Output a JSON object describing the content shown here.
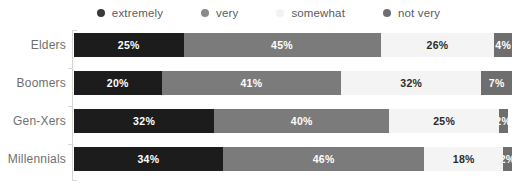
{
  "chart_data": {
    "type": "bar",
    "orientation": "horizontal",
    "stacked": true,
    "stack_total": 100,
    "unit": "%",
    "title": "",
    "subtitle": "",
    "xlabel": "",
    "ylabel": "",
    "xlim": [
      0,
      100
    ],
    "grid": false,
    "legend_position": "top",
    "categories": [
      "Elders",
      "Boomers",
      "Gen-Xers",
      "Millennials"
    ],
    "series": [
      {
        "name": "extremely",
        "color": "#1c1c1c",
        "label_color": "#ffffff",
        "values": [
          25,
          20,
          32,
          34
        ]
      },
      {
        "name": "very",
        "color": "#7b7b7b",
        "label_color": "#ffffff",
        "values": [
          45,
          41,
          40,
          46
        ]
      },
      {
        "name": "somewhat",
        "color": "#f4f4f4",
        "label_color": "#2b2b2b",
        "values": [
          26,
          32,
          25,
          18
        ]
      },
      {
        "name": "not very",
        "color": "#6e6e6e",
        "label_color": "#ffffff",
        "values": [
          4,
          7,
          2,
          2
        ]
      }
    ],
    "value_labels": [
      [
        "25%",
        "45%",
        "26%",
        "4%"
      ],
      [
        "20%",
        "41%",
        "32%",
        "7%"
      ],
      [
        "32%",
        "40%",
        "25%",
        "2%"
      ],
      [
        "34%",
        "46%",
        "18%",
        "2%"
      ]
    ]
  },
  "legend": {
    "items": [
      {
        "label": "extremely",
        "marker_color": "#3a3a3a",
        "marker": "legend-dot-extremely"
      },
      {
        "label": "very",
        "marker_color": "#8a8a8a",
        "marker": "legend-dot-very"
      },
      {
        "label": "somewhat",
        "marker_color": "#f2f2f2",
        "marker": "legend-dot-somewhat"
      },
      {
        "label": "not very",
        "marker_color": "#6e6e6e",
        "marker": "legend-dot-not-very"
      }
    ]
  },
  "axis": {
    "label_color": "#6f6f6f",
    "line_color": "#d6d6d6"
  }
}
